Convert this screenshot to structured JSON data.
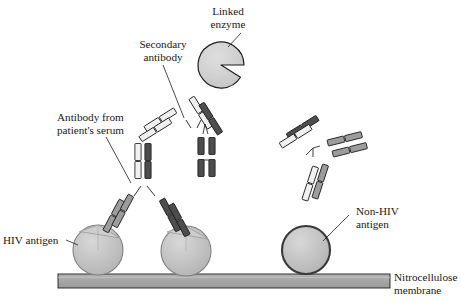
{
  "figure": {
    "width": 461,
    "height": 306,
    "background": "#ffffff"
  },
  "labels": {
    "linked_enzyme": {
      "line1": "Linked",
      "line2": "enzyme"
    },
    "secondary_antibody": {
      "line1": "Secondary",
      "line2": "antibody"
    },
    "patient_antibody": {
      "line1": "Antibody from",
      "line2": "patient's serum"
    },
    "hiv_antigen": {
      "line1": "HIV antigen"
    },
    "non_hiv_antigen": {
      "line1": "Non-HIV",
      "line2": "antigen"
    },
    "membrane": {
      "line1": "Nitrocellulose",
      "line2": "membrane"
    }
  },
  "colors": {
    "outline": "#1d1d1d",
    "text": "#181818",
    "enzyme_fill": "#d0d0d0",
    "antigen_fill": "#c0c0c0",
    "antigen_shade": "#b0b0b0",
    "antigen_highlight": "#cfcfcf",
    "membrane_fill": "#a8a8a8",
    "membrane_edge": "#8f8f8f",
    "chain_light": "#f2f2f2",
    "chain_mid": "#9a9a9a",
    "chain_dark": "#4a4a4a",
    "chain_darkest": "#3a3a3a",
    "background": "#ffffff"
  },
  "elements": {
    "membrane": {
      "name": "nitrocellulose-membrane",
      "x": 58,
      "y": 274,
      "width": 332,
      "height": 14
    },
    "antigens": [
      {
        "name": "hiv-antigen-left",
        "type": "hiv",
        "cx": 98,
        "cy": 250,
        "r": 25,
        "notched": true
      },
      {
        "name": "hiv-antigen-right",
        "type": "hiv",
        "cx": 186,
        "cy": 251,
        "r": 25,
        "notched": true
      },
      {
        "name": "non-hiv-antigen",
        "type": "non-hiv",
        "cx": 306,
        "cy": 250,
        "r": 24,
        "notched": false
      }
    ],
    "enzyme": {
      "name": "linked-enzyme",
      "cx": 221,
      "cy": 65,
      "r": 23,
      "mouth_angle_deg": 50
    },
    "antibodies": [
      {
        "name": "patient-antibody-bound",
        "role": "primary",
        "description": "Y-shaped antibody bridging two HIV antigens"
      },
      {
        "name": "secondary-antibody-enzyme-linked",
        "role": "secondary",
        "description": "antibody carrying linked enzyme"
      },
      {
        "name": "secondary-antibody-unbound",
        "role": "secondary",
        "description": "free vertical antibody fragment"
      },
      {
        "name": "free-antibody-complex",
        "role": "free",
        "description": "unbound antibody complex at right"
      }
    ]
  }
}
